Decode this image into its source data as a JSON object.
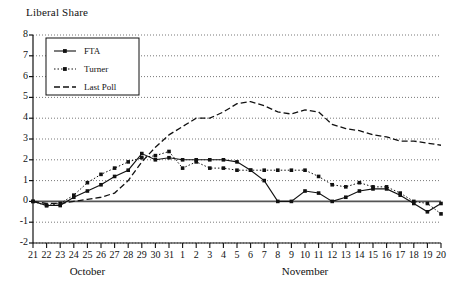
{
  "chart": {
    "title": "Liberal Share",
    "type": "line"
  },
  "axes": {
    "y_ticks": [
      "8",
      "7",
      "6",
      "5",
      "4",
      "3",
      "2",
      "1",
      "0",
      "-1",
      "-2"
    ],
    "x_ticks": [
      "21",
      "22",
      "23",
      "24",
      "25",
      "26",
      "27",
      "28",
      "29",
      "30",
      "31",
      "1",
      "2",
      "3",
      "4",
      "5",
      "6",
      "7",
      "8",
      "9",
      "10",
      "11",
      "12",
      "13",
      "14",
      "15",
      "16",
      "17",
      "18",
      "19",
      "20"
    ],
    "month_labels": [
      "October",
      "November"
    ]
  },
  "legend": {
    "items": [
      {
        "label": "FTA",
        "style": "solid-marker"
      },
      {
        "label": "Turner",
        "style": "dotted-marker"
      },
      {
        "label": "Last Poll",
        "style": "dashed"
      }
    ]
  },
  "chart_data": {
    "type": "line",
    "title": "Liberal Share",
    "xlabel": "",
    "ylabel": "",
    "ylim": [
      -2,
      8
    ],
    "grid": true,
    "legend_position": "top-left",
    "categories": [
      "21",
      "22",
      "23",
      "24",
      "25",
      "26",
      "27",
      "28",
      "29",
      "30",
      "31",
      "1",
      "2",
      "3",
      "4",
      "5",
      "6",
      "7",
      "8",
      "9",
      "10",
      "11",
      "12",
      "13",
      "14",
      "15",
      "16",
      "17",
      "18",
      "19",
      "20"
    ],
    "x_note": "Oct 21 - Oct 31, then Nov 1 - Nov 20",
    "series": [
      {
        "name": "FTA",
        "style": "solid-marker",
        "values": [
          0.0,
          -0.2,
          -0.2,
          0.2,
          0.5,
          0.8,
          1.2,
          1.5,
          2.3,
          2.0,
          2.1,
          2.0,
          2.0,
          2.0,
          2.0,
          1.9,
          1.5,
          1.0,
          0.0,
          0.0,
          0.5,
          0.4,
          0.0,
          0.2,
          0.5,
          0.6,
          0.6,
          0.3,
          -0.1,
          -0.5,
          -0.1
        ]
      },
      {
        "name": "Turner",
        "style": "dotted-marker",
        "values": [
          0.0,
          -0.2,
          -0.1,
          0.3,
          0.9,
          1.3,
          1.6,
          1.9,
          2.1,
          2.2,
          2.4,
          1.6,
          1.9,
          1.6,
          1.6,
          1.5,
          1.5,
          1.5,
          1.5,
          1.5,
          1.5,
          1.2,
          0.8,
          0.7,
          0.9,
          0.7,
          0.7,
          0.4,
          0.0,
          -0.1,
          -0.6
        ]
      },
      {
        "name": "Last Poll",
        "style": "dashed",
        "values": [
          0.0,
          -0.1,
          -0.1,
          0.0,
          0.1,
          0.2,
          0.4,
          1.0,
          1.9,
          2.6,
          3.2,
          3.6,
          4.0,
          4.0,
          4.3,
          4.7,
          4.8,
          4.6,
          4.3,
          4.2,
          4.4,
          4.3,
          3.7,
          3.5,
          3.4,
          3.2,
          3.1,
          2.9,
          2.9,
          2.8,
          2.7
        ]
      }
    ]
  }
}
